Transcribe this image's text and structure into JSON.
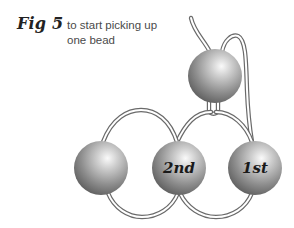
{
  "figure": {
    "label": "Fig 5",
    "caption_lines": [
      "to start picking up",
      "one bead"
    ]
  },
  "beads": [
    {
      "id": "top",
      "label": ""
    },
    {
      "id": "left",
      "label": ""
    },
    {
      "id": "second",
      "label": "2nd"
    },
    {
      "id": "first",
      "label": "1st"
    }
  ],
  "colors": {
    "bead_light": "#f4f4f4",
    "bead_mid": "#9a9a9a",
    "bead_dark": "#5c5c5c",
    "thread": "#6a6a6a"
  }
}
